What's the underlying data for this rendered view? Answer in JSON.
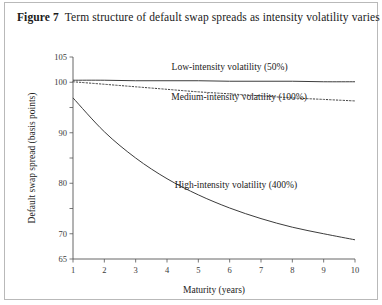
{
  "figure": {
    "number_label": "Figure 7",
    "caption": "Term structure of default swap spreads as intensity volatility varies"
  },
  "chart_data": {
    "type": "line",
    "title": "Term structure of default swap spreads as intensity volatility varies",
    "xlabel": "Maturity (years)",
    "ylabel": "Default swap spread (basis points)",
    "xlim": [
      1,
      10
    ],
    "ylim": [
      65,
      105
    ],
    "grid": false,
    "legend_position": "inline-annotations",
    "x_ticks": [
      1,
      2,
      3,
      4,
      5,
      6,
      7,
      8,
      9,
      10
    ],
    "x_tick_labels": [
      "1",
      "2",
      "3",
      "4",
      "5",
      "6",
      "7",
      "8",
      "9",
      "10"
    ],
    "y_ticks": [
      65,
      70,
      75,
      80,
      85,
      90,
      95,
      100,
      105
    ],
    "y_tick_labels": [
      "65",
      "70",
      "",
      "80",
      "",
      "90",
      "",
      "100",
      "105"
    ],
    "x": [
      1,
      2,
      3,
      4,
      5,
      6,
      7,
      8,
      9,
      10
    ],
    "series": [
      {
        "name": "Low-intensity volatility (50%)",
        "style": "solid",
        "values": [
          100.4,
          100.4,
          100.3,
          100.3,
          100.3,
          100.2,
          100.2,
          100.2,
          100.1,
          100.1
        ]
      },
      {
        "name": "Medium-intensity volatility (100%)",
        "style": "dotted",
        "values": [
          100.1,
          99.6,
          99.1,
          98.6,
          98.1,
          97.7,
          97.3,
          96.9,
          96.6,
          96.3
        ]
      },
      {
        "name": "High-intensity volatility (400%)",
        "style": "solid",
        "values": [
          96.9,
          90.2,
          85.0,
          80.9,
          77.7,
          75.1,
          73.0,
          71.3,
          70.0,
          68.8
        ]
      }
    ],
    "annotations": [
      {
        "text": "Low-intensity volatility (50%)",
        "x": 6.0,
        "y": 102.5
      },
      {
        "text": "Medium-intensity volatility (100%)",
        "x": 6.3,
        "y": 96.4
      },
      {
        "text": "High-intensity volatility (400%)",
        "x": 6.2,
        "y": 79.0
      }
    ]
  }
}
